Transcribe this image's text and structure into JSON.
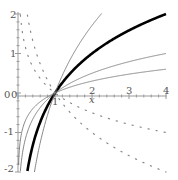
{
  "chart_data": {
    "type": "line",
    "title": "",
    "xlabel": "x",
    "ylabel": "",
    "xlim": [
      0,
      4
    ],
    "ylim": [
      -2,
      2
    ],
    "grid": false,
    "legend": null,
    "x_ticks": [
      "0",
      "1",
      "2",
      "3",
      "4"
    ],
    "y_ticks": [
      "2",
      "1",
      "0",
      "-1",
      "-2"
    ],
    "origin_label": "0",
    "series": [
      {
        "name": "log_2(x)",
        "base": 2,
        "style": "thick-solid",
        "color": "#000000",
        "points": [
          [
            0.25,
            -2
          ],
          [
            0.5,
            -1
          ],
          [
            1,
            0
          ],
          [
            2,
            1
          ],
          [
            3,
            1.58
          ],
          [
            4,
            2
          ]
        ]
      },
      {
        "name": "log_1.5(x)",
        "base": 1.5,
        "style": "thin-solid",
        "color": "#777777",
        "points": [
          [
            0.44,
            -2
          ],
          [
            0.67,
            -1
          ],
          [
            1,
            0
          ],
          [
            1.5,
            1
          ],
          [
            2.25,
            2
          ]
        ]
      },
      {
        "name": "log_4(x)",
        "base": 4,
        "style": "thin-solid",
        "color": "#777777",
        "points": [
          [
            0.0625,
            -2
          ],
          [
            0.25,
            -1
          ],
          [
            1,
            0
          ],
          [
            2,
            0.5
          ],
          [
            3,
            0.79
          ],
          [
            4,
            1
          ]
        ]
      },
      {
        "name": "log_10(x)",
        "base": 10,
        "style": "thin-solid",
        "color": "#777777",
        "points": [
          [
            0.01,
            -2
          ],
          [
            0.1,
            -1
          ],
          [
            1,
            0
          ],
          [
            2,
            0.3
          ],
          [
            3,
            0.48
          ],
          [
            4,
            0.6
          ]
        ]
      },
      {
        "name": "log_1/2(x)",
        "base": 0.5,
        "style": "dotted",
        "color": "#888888",
        "points": [
          [
            0.25,
            2
          ],
          [
            0.5,
            1
          ],
          [
            1,
            0
          ],
          [
            2,
            -1
          ],
          [
            3,
            -1.58
          ],
          [
            4,
            -2
          ]
        ]
      },
      {
        "name": "log_1/4(x)",
        "base": 0.25,
        "style": "dotted",
        "color": "#888888",
        "points": [
          [
            0.0625,
            2
          ],
          [
            0.25,
            1
          ],
          [
            1,
            0
          ],
          [
            2,
            -0.5
          ],
          [
            3,
            -0.79
          ],
          [
            4,
            -1
          ]
        ]
      }
    ]
  },
  "axes": {
    "x_label": "x",
    "x_tick_labels": [
      "1",
      "2",
      "3",
      "4"
    ],
    "y_tick_labels": [
      "2",
      "1",
      "-1",
      "-2"
    ],
    "origin_x": "0",
    "origin_y": "0"
  }
}
